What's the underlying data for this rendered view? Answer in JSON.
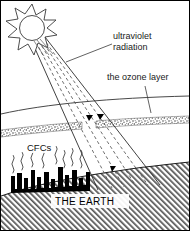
{
  "figure": {
    "width": 190,
    "height": 231,
    "background_color": "#ffffff",
    "border_color": "#000000"
  },
  "labels": {
    "ultraviolet_line1": "ultraviolet",
    "ultraviolet_line2": "radiation",
    "ozone_layer": "the ozone layer",
    "cfcs": "CFCs",
    "the_earth": "THE EARTH"
  },
  "colors": {
    "ink": "#1a1a1a",
    "line": "#3a3a3a",
    "city": "#000000",
    "ozone_band": "#7a7a7a",
    "ground_hatch": "#555555",
    "white": "#ffffff"
  },
  "elements": {
    "sun": "sun-with-rays",
    "beam": "ultraviolet-beam",
    "atmosphere_arc": "upper-atmosphere-boundary",
    "ozone_band": "stippled-ozone-band-with-gap",
    "ozone_arrows": "two-downward-arrowheads-at-gap",
    "ground_arrow": "arrowhead-reaching-ground",
    "cfc_squiggles": "rising-cfc-wavy-lines",
    "city": "black-city-skyline",
    "ground": "hatched-earth-surface"
  }
}
